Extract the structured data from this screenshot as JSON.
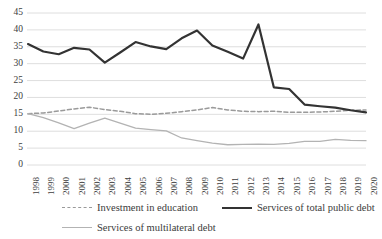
{
  "chart_data": {
    "type": "line",
    "title": "",
    "xlabel": "",
    "ylabel": "",
    "ylim": [
      0,
      45
    ],
    "yticks": [
      0,
      5,
      10,
      15,
      20,
      25,
      30,
      35,
      40,
      45
    ],
    "grid": true,
    "legend_position": "bottom",
    "categories": [
      "1998",
      "1999",
      "2000",
      "2001",
      "2002",
      "2003",
      "2004",
      "2005",
      "2006",
      "2007",
      "2008",
      "2009",
      "2010",
      "2011",
      "2012",
      "2013",
      "2014",
      "2015",
      "2016",
      "2017",
      "2018",
      "2019",
      "2020"
    ],
    "series": [
      {
        "name": "Investment in education",
        "style": "dashed",
        "color": "#9a9a9a",
        "values": [
          15.2,
          15.4,
          16.0,
          16.6,
          17.1,
          16.4,
          15.9,
          15.2,
          15.0,
          15.3,
          15.8,
          16.3,
          17.0,
          16.3,
          15.9,
          15.8,
          15.9,
          15.6,
          15.6,
          15.7,
          15.9,
          16.2,
          16.3
        ]
      },
      {
        "name": "Services of total public debt",
        "style": "solid",
        "color": "#333333",
        "values": [
          35.8,
          33.6,
          32.8,
          34.7,
          34.2,
          30.3,
          33.3,
          36.4,
          35.1,
          34.3,
          37.5,
          39.8,
          35.4,
          33.5,
          31.5,
          41.6,
          23.0,
          22.5,
          17.9,
          17.4,
          17.0,
          16.2,
          15.6
        ]
      },
      {
        "name": "Services of multilateral debt",
        "style": "solid",
        "color": "#b3b3b3",
        "values": [
          15.2,
          14.0,
          12.5,
          10.8,
          12.4,
          13.9,
          12.4,
          10.9,
          10.5,
          10.1,
          8.0,
          7.2,
          6.5,
          6.0,
          6.1,
          6.2,
          6.1,
          6.4,
          7.0,
          7.0,
          7.6,
          7.3,
          7.2
        ]
      }
    ]
  },
  "legend": {
    "rows": [
      [
        {
          "label": "Investment in education",
          "swatch": "dashed-gray-line-icon"
        },
        {
          "label": "Services of total public debt",
          "swatch": "solid-black-line-icon"
        }
      ],
      [
        {
          "label": "Services of multilateral debt",
          "swatch": "solid-gray-line-icon"
        }
      ]
    ]
  }
}
